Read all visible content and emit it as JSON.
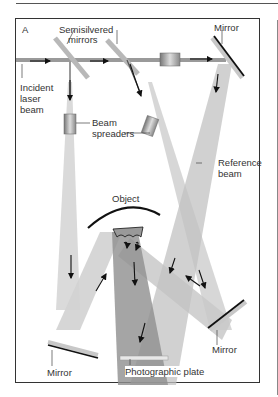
{
  "figure": {
    "panel_label": "A",
    "labels": {
      "semisilvered_mirrors": [
        "Semisilvered",
        "mirrors"
      ],
      "mirror_top_right": "Mirror",
      "incident_laser_beam": [
        "Incident",
        "laser",
        "beam"
      ],
      "beam_spreaders": [
        "Beam",
        "spreaders"
      ],
      "reference_beam": [
        "Reference",
        "beam"
      ],
      "object": "Object",
      "mirror_bottom_left": "Mirror",
      "mirror_bottom_right": "Mirror",
      "photographic_plate": "Photographic plate"
    },
    "colors": {
      "beam_light": "#d9d9d9",
      "beam_mid": "#bdbdbd",
      "beam_dark": "#8f8f8f",
      "mirror_dark": "#111111",
      "mirror_light": "#c8c8c8",
      "frame": "#333333"
    }
  }
}
